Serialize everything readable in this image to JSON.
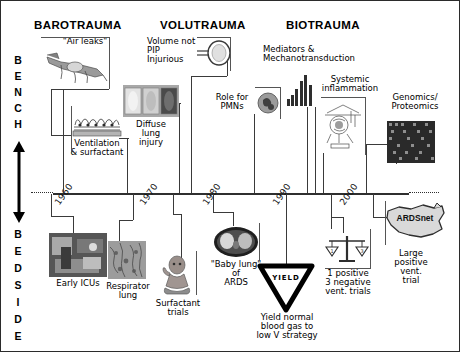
{
  "figure": {
    "type": "timeline-diagram",
    "title_columns": [
      {
        "id": "barotrauma",
        "label": "BAROTRAUMA"
      },
      {
        "id": "volutrauma",
        "label": "VOLUTRAUMA"
      },
      {
        "id": "biotrauma",
        "label": "BIOTRAUMA"
      }
    ],
    "axis": {
      "top_label": "BENCH",
      "bottom_label": "BEDSIDE",
      "top_letters": [
        "B",
        "E",
        "N",
        "C",
        "H"
      ],
      "bottom_letters": [
        "B",
        "E",
        "D",
        "S",
        "I",
        "D",
        "E"
      ],
      "arrow": "double-headed-vertical-arrow"
    },
    "timeline": {
      "years": [
        "1960",
        "1970",
        "1980",
        "1990",
        "2000"
      ],
      "orientation": "rotated-diagonal",
      "line_style": "solid-with-dotted-ends"
    },
    "bench_nodes": [
      {
        "id": "air-leaks",
        "label": "\"Air leaks\"",
        "icon": "animal-lung-barotrauma-image"
      },
      {
        "id": "ventilation-surfactant",
        "label": "Ventilation\n& surfactant",
        "icon": "alveoli-surfactant-image"
      },
      {
        "id": "diffuse-lung-injury",
        "label": "Diffuse\nlung\ninjury",
        "icon": "lung-histology-panels-image"
      },
      {
        "id": "volume-not-pip",
        "label": "Volume not\nPIP\nInjurious",
        "icon": "balloon-syringe-diagram"
      },
      {
        "id": "role-for-pmns",
        "label": "Role for\nPMNs",
        "icon": "neutrophil-cell-image"
      },
      {
        "id": "mediators",
        "label": "Mediators &\nMechanotransduction",
        "icon": "bar-chart-cytokines-image"
      },
      {
        "id": "systemic-inflammation",
        "label": "Systemic\ninflammation",
        "icon": "inflammation-schematic-image"
      },
      {
        "id": "genomics-proteomics",
        "label": "Genomics/\nProteomics",
        "icon": "microarray-grid-image"
      }
    ],
    "bedside_nodes": [
      {
        "id": "early-icus",
        "label": "Early ICUs",
        "icon": "early-icu-ward-photo"
      },
      {
        "id": "respirator-lung",
        "label": "Respirator\nlung",
        "icon": "respirator-lung-histology-photo"
      },
      {
        "id": "surfactant-trials",
        "label": "Surfactant\ntrials",
        "icon": "neonate-infant-photo"
      },
      {
        "id": "baby-lung",
        "label": "\"Baby lung\"\nof\nARDS",
        "icon": "chest-ct-scan-image"
      },
      {
        "id": "yield",
        "label": "Yield normal\nblood gas to\nlow V strategy",
        "icon": "yield-sign",
        "sign_text": "YIELD"
      },
      {
        "id": "vent-trials",
        "label": "1 positive\n3 negative\nvent. trials",
        "icon": "balance-scale-icon"
      },
      {
        "id": "ardsnet",
        "label": "Large\npositive\nvent.\ntrial",
        "icon": "usa-map-icon",
        "map_text": "ARDSnet"
      }
    ],
    "colors": {
      "ink": "#000000",
      "line": "#3a3a3a",
      "border": "#2b2b2b",
      "image_fill": "#b9b9b9"
    }
  }
}
